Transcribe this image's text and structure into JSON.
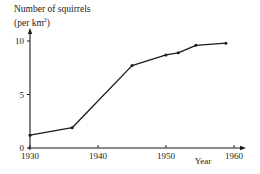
{
  "chart_data": {
    "type": "line",
    "title": "",
    "ylabel": "Number of squirrels (per km²)",
    "ylabel_line1": "Number of squirrels",
    "ylabel_line2_prefix": "(per km",
    "ylabel_line2_sup": "2",
    "ylabel_line2_suffix": ")",
    "xlabel": "Year",
    "xlim": [
      1930,
      1960
    ],
    "ylim": [
      0,
      10
    ],
    "x_ticks": [
      1930,
      1940,
      1950,
      1960
    ],
    "y_ticks": [
      0,
      5,
      10
    ],
    "grid": false,
    "legend": null,
    "series": [
      {
        "name": "Squirrel density",
        "x": [
          1930,
          1936.2,
          1945,
          1950,
          1951.8,
          1954.4,
          1958.8
        ],
        "y": [
          1.2,
          1.9,
          7.7,
          8.7,
          8.9,
          9.6,
          9.8
        ]
      }
    ],
    "color": "#1a1a1a"
  }
}
